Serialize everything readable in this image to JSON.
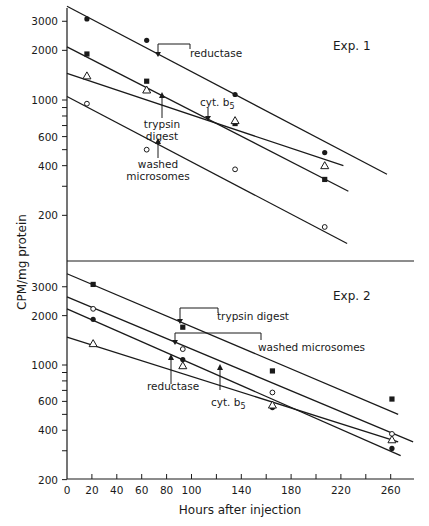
{
  "chart_data": [
    {
      "type": "scatter",
      "title": "Exp. 1",
      "xlabel": "Hours after injection",
      "ylabel": "CPM/mg protein",
      "yscale": "log",
      "xlim": [
        0,
        280
      ],
      "ylim": [
        100,
        3500
      ],
      "y_ticks_labeled": [
        200,
        400,
        600,
        1000,
        2000,
        3000
      ],
      "series": [
        {
          "name": "reductase",
          "marker": "filled-circle",
          "x": [
            16,
            64,
            135,
            207
          ],
          "y": [
            3100,
            2300,
            1080,
            480
          ],
          "fit_line": {
            "x": [
              0,
              257
            ],
            "y": [
              3700,
              355
            ]
          }
        },
        {
          "name": "trypsin digest",
          "marker": "filled-square",
          "x": [
            16,
            64,
            135,
            207
          ],
          "y": [
            1900,
            1300,
            720,
            330
          ],
          "fit_line": {
            "x": [
              0,
              226
            ],
            "y": [
              2100,
              280
            ]
          }
        },
        {
          "name": "cyt. b5",
          "marker": "open-triangle",
          "x": [
            16,
            64,
            135,
            207
          ],
          "y": [
            1400,
            1150,
            750,
            400
          ],
          "fit_line": {
            "x": [
              0,
              222
            ],
            "y": [
              1450,
              400
            ]
          }
        },
        {
          "name": "washed microsomes",
          "marker": "open-circle",
          "x": [
            16,
            64,
            135,
            207
          ],
          "y": [
            950,
            500,
            380,
            170
          ],
          "fit_line": {
            "x": [
              0,
              225
            ],
            "y": [
              1050,
              135
            ]
          }
        }
      ],
      "annotations": [
        {
          "text": "reductase",
          "style": "bracket",
          "arrow_x": 73
        },
        {
          "text": "trypsin digest",
          "style": "arrow-up",
          "arrow_x": 76
        },
        {
          "text": "cyt. b5",
          "style": "arrow-down",
          "arrow_x": 113
        },
        {
          "text": "washed microsomes",
          "style": "arrow-up",
          "arrow_x": 73
        }
      ]
    },
    {
      "type": "scatter",
      "title": "Exp. 2",
      "xlabel": "Hours after injection",
      "ylabel": "CPM/mg protein",
      "yscale": "log",
      "xlim": [
        0,
        280
      ],
      "ylim": [
        200,
        3700
      ],
      "x_ticks": [
        0,
        20,
        40,
        60,
        80,
        100,
        140,
        180,
        220,
        260
      ],
      "y_ticks_labeled": [
        200,
        400,
        600,
        1000,
        2000,
        3000
      ],
      "series": [
        {
          "name": "trypsin digest",
          "marker": "filled-square",
          "x": [
            21,
            93,
            165,
            261
          ],
          "y": [
            3100,
            1700,
            920,
            620
          ],
          "fit_line": {
            "x": [
              0,
              266
            ],
            "y": [
              3600,
              500
            ]
          }
        },
        {
          "name": "washed microsomes",
          "marker": "open-circle",
          "x": [
            21,
            93,
            165,
            261
          ],
          "y": [
            2200,
            1250,
            680,
            380
          ],
          "fit_line": {
            "x": [
              0,
              278
            ],
            "y": [
              2600,
              340
            ]
          }
        },
        {
          "name": "reductase",
          "marker": "filled-circle",
          "x": [
            21,
            93,
            165,
            261
          ],
          "y": [
            1900,
            1080,
            550,
            310
          ],
          "fit_line": {
            "x": [
              0,
              268
            ],
            "y": [
              2200,
              280
            ]
          }
        },
        {
          "name": "cyt. b5",
          "marker": "open-triangle",
          "x": [
            21,
            93,
            165,
            261
          ],
          "y": [
            1350,
            990,
            570,
            350
          ],
          "fit_line": {
            "x": [
              0,
              266
            ],
            "y": [
              1480,
              340
            ]
          }
        }
      ],
      "annotations": [
        {
          "text": "trypsin digest",
          "style": "bracket",
          "arrow_x": 91
        },
        {
          "text": "washed microsomes",
          "style": "bracket",
          "arrow_x": 87
        },
        {
          "text": "reductase",
          "style": "arrow-up",
          "arrow_x": 84
        },
        {
          "text": "cyt. b5",
          "style": "arrow-up",
          "arrow_x": 123
        }
      ]
    }
  ],
  "labels": {
    "exp1": "Exp. 1",
    "exp2": "Exp. 2",
    "ylabel": "CPM/mg protein",
    "xlabel": "Hours after injection",
    "x_tick_labels": [
      "0",
      "20",
      "40",
      "60",
      "80",
      "100",
      "140",
      "180",
      "220",
      "260"
    ],
    "y_tick_labels": [
      "3000",
      "2000",
      "1000",
      "600",
      "400",
      "200"
    ],
    "anno": {
      "e1_reductase": "reductase",
      "e1_trypsin_1": "trypsin",
      "e1_trypsin_2": "digest",
      "e1_cyt": "cyt. b",
      "e1_cyt_sub": "5",
      "e1_washed_1": "washed",
      "e1_washed_2": "microsomes",
      "e2_trypsin": "trypsin digest",
      "e2_washed": "washed microsomes",
      "e2_reductase": "reductase",
      "e2_cyt": "cyt. b",
      "e2_cyt_sub": "5"
    }
  }
}
